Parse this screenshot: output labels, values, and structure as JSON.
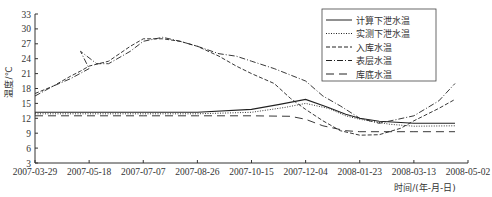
{
  "chart_data": {
    "type": "line",
    "title": "",
    "xlabel": "时间/(年-月-日)",
    "ylabel": "温度/℃",
    "ylim": [
      3,
      33
    ],
    "yticks": [
      3,
      6,
      9,
      12,
      15,
      18,
      21,
      24,
      27,
      30,
      33
    ],
    "xticks": [
      "2007-03-29",
      "2007-05-18",
      "2007-07-07",
      "2007-08-26",
      "2007-10-15",
      "2007-12-04",
      "2008-01-23",
      "2008-03-13",
      "2008-05-02"
    ],
    "grid": false,
    "legend_position": "upper right",
    "series": [
      {
        "name": "计算下泄水温",
        "style": "solid",
        "points": [
          [
            "2007-03-29",
            13.2
          ],
          [
            "2007-05-18",
            13.2
          ],
          [
            "2007-07-07",
            13.2
          ],
          [
            "2007-08-26",
            13.2
          ],
          [
            "2007-10-15",
            13.8
          ],
          [
            "2007-11-10",
            14.8
          ],
          [
            "2007-12-04",
            15.8
          ],
          [
            "2007-12-25",
            14.2
          ],
          [
            "2008-01-10",
            12.8
          ],
          [
            "2008-01-23",
            12.0
          ],
          [
            "2008-02-10",
            11.4
          ],
          [
            "2008-03-13",
            11.0
          ],
          [
            "2008-04-20",
            11.0
          ]
        ]
      },
      {
        "name": "实测下泄水温",
        "style": "dotted",
        "points": [
          [
            "2007-03-29",
            12.9
          ],
          [
            "2007-05-18",
            12.9
          ],
          [
            "2007-07-07",
            12.9
          ],
          [
            "2007-08-26",
            12.9
          ],
          [
            "2007-10-15",
            13.2
          ],
          [
            "2007-11-15",
            14.2
          ],
          [
            "2007-12-04",
            15.0
          ],
          [
            "2007-12-25",
            14.0
          ],
          [
            "2008-01-10",
            12.5
          ],
          [
            "2008-01-23",
            11.8
          ],
          [
            "2008-02-20",
            10.8
          ],
          [
            "2008-03-13",
            10.4
          ],
          [
            "2008-04-20",
            10.5
          ]
        ]
      },
      {
        "name": "入库水温",
        "style": "dashed",
        "points": [
          [
            "2007-03-29",
            17.0
          ],
          [
            "2007-04-15",
            18.5
          ],
          [
            "2007-05-01",
            20.5
          ],
          [
            "2007-05-10",
            21.5
          ],
          [
            "2007-05-18",
            22.5
          ],
          [
            "2007-06-05",
            23.5
          ],
          [
            "2007-06-25",
            26.5
          ],
          [
            "2007-07-07",
            28.0
          ],
          [
            "2007-07-25",
            28.0
          ],
          [
            "2007-08-10",
            27.5
          ],
          [
            "2007-08-26",
            26.5
          ],
          [
            "2007-09-15",
            24.5
          ],
          [
            "2007-10-01",
            22.5
          ],
          [
            "2007-10-15",
            21.0
          ],
          [
            "2007-11-05",
            19.0
          ],
          [
            "2007-11-20",
            16.0
          ],
          [
            "2007-12-04",
            13.8
          ],
          [
            "2007-12-20",
            11.5
          ],
          [
            "2008-01-05",
            9.5
          ],
          [
            "2008-01-23",
            8.6
          ],
          [
            "2008-02-10",
            8.7
          ],
          [
            "2008-03-01",
            10.0
          ],
          [
            "2008-03-13",
            11.5
          ],
          [
            "2008-04-05",
            14.0
          ],
          [
            "2008-04-20",
            15.8
          ]
        ]
      },
      {
        "name": "表层水温",
        "style": "dash-dot",
        "points": [
          [
            "2007-03-29",
            16.5
          ],
          [
            "2007-04-15",
            18.5
          ],
          [
            "2007-05-01",
            20.0
          ],
          [
            "2007-05-18",
            22.0
          ],
          [
            "2007-05-10",
            25.5
          ],
          [
            "2007-05-25",
            23.0
          ],
          [
            "2007-06-05",
            23.0
          ],
          [
            "2007-06-25",
            25.5
          ],
          [
            "2007-07-07",
            27.5
          ],
          [
            "2007-07-25",
            28.3
          ],
          [
            "2007-08-10",
            27.5
          ],
          [
            "2007-08-26",
            26.5
          ],
          [
            "2007-09-15",
            25.0
          ],
          [
            "2007-10-01",
            24.5
          ],
          [
            "2007-10-15",
            23.5
          ],
          [
            "2007-11-05",
            22.0
          ],
          [
            "2007-12-04",
            19.5
          ],
          [
            "2007-12-20",
            16.5
          ],
          [
            "2008-01-05",
            14.5
          ],
          [
            "2008-01-23",
            12.0
          ],
          [
            "2008-02-10",
            11.0
          ],
          [
            "2008-03-13",
            12.5
          ],
          [
            "2008-04-05",
            15.5
          ],
          [
            "2008-04-20",
            19.0
          ]
        ]
      },
      {
        "name": "库底水温",
        "style": "long-dash",
        "points": [
          [
            "2007-03-29",
            12.5
          ],
          [
            "2007-05-18",
            12.5
          ],
          [
            "2007-07-07",
            12.5
          ],
          [
            "2007-08-26",
            12.5
          ],
          [
            "2007-10-15",
            12.5
          ],
          [
            "2007-11-20",
            12.4
          ],
          [
            "2007-12-04",
            11.8
          ],
          [
            "2007-12-20",
            10.5
          ],
          [
            "2008-01-10",
            9.5
          ],
          [
            "2008-01-23",
            9.3
          ],
          [
            "2008-03-13",
            9.3
          ],
          [
            "2008-04-20",
            9.3
          ]
        ]
      }
    ]
  }
}
